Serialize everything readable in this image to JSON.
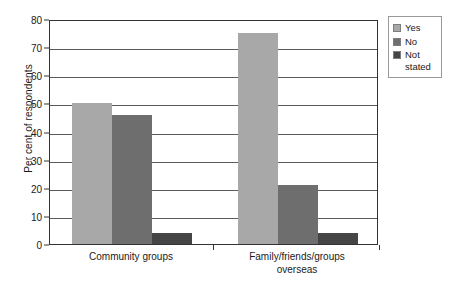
{
  "chart_data": {
    "type": "bar",
    "title": "",
    "subtitle": "",
    "xlabel": "",
    "ylabel": "Per cent of respondents",
    "ylim": [
      0,
      80
    ],
    "yticks": [
      0,
      10,
      20,
      30,
      40,
      50,
      60,
      70,
      80
    ],
    "ytick_labels": [
      "0",
      "10",
      "20",
      "30",
      "40",
      "50",
      "60",
      "70",
      "80"
    ],
    "grid": true,
    "grid_axis": "y",
    "legend_position": "top-right",
    "categories": [
      "Community groups",
      "Family/friends/groups\noverseas"
    ],
    "category_lines": [
      [
        "Community groups"
      ],
      [
        "Family/friends/groups",
        "overseas"
      ]
    ],
    "series": [
      {
        "name": "Yes",
        "color": "#a8a8a8",
        "values": [
          50,
          75
        ]
      },
      {
        "name": "No",
        "color": "#6e6e6e",
        "values": [
          46,
          21
        ]
      },
      {
        "name": "Not stated",
        "color": "#454545",
        "values": [
          4,
          4
        ]
      }
    ]
  },
  "legend": {
    "items": [
      {
        "label": "Yes",
        "color": "#a8a8a8"
      },
      {
        "label": "No",
        "color": "#6e6e6e"
      },
      {
        "label": "Not\nstated",
        "color": "#454545"
      }
    ]
  },
  "axes": {
    "y_title": "Per cent of respondents",
    "y_tick_labels": [
      "80",
      "70",
      "60",
      "50",
      "40",
      "30",
      "20",
      "10",
      "0"
    ],
    "x_labels": [
      "Community groups",
      "Family/friends/groups overseas"
    ]
  }
}
